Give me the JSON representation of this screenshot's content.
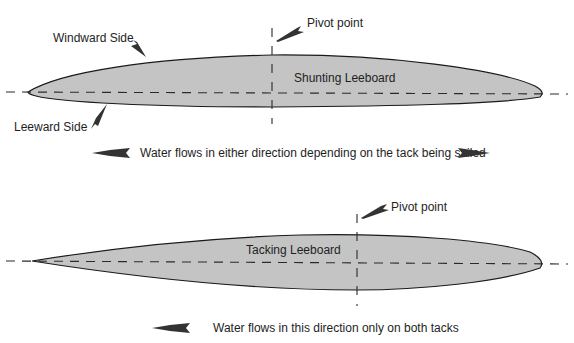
{
  "diagram": {
    "shunting": {
      "title": "Shunting Leeboard",
      "windward_label": "Windward Side",
      "leeward_label": "Leeward Side",
      "pivot_label": "Pivot point",
      "flow_text": "Water flows in either direction depending on the tack being sailed",
      "flow_arrows": [
        "left-arrow",
        "right-arrow"
      ]
    },
    "tacking": {
      "title": "Tacking Leeboard",
      "pivot_label": "Pivot point",
      "flow_text": "Water flows in this direction only on both tacks",
      "flow_arrows": [
        "left-arrow"
      ]
    },
    "colors": {
      "foil_fill": "#c4c4c4",
      "outline": "#1a1a1a",
      "text": "#1e1e1e"
    }
  }
}
